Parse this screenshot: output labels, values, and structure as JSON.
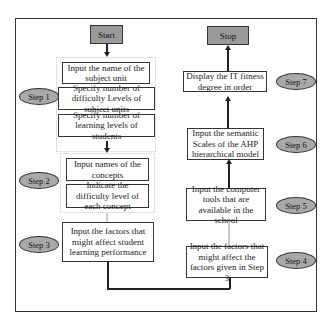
{
  "diagram": {
    "type": "flowchart",
    "start_label": "Start",
    "stop_label": "Stop",
    "left_column": {
      "step1": {
        "label": "Step 1",
        "boxes": [
          "Input the name of the subject unit",
          "Specify number of difficulty Levels of subject units",
          "Specify number of learning levels of students"
        ]
      },
      "step2": {
        "label": "Step 2",
        "boxes": [
          "Input names of the concepts",
          "Indicate the difficulty level of each concept"
        ]
      },
      "step3": {
        "label": "Step 3",
        "boxes": [
          "Input the factors that might affect student learning performance"
        ]
      }
    },
    "right_column": {
      "step4": {
        "label": "Step 4",
        "box": "Input the factors that might affect the factors given in Step 3"
      },
      "step5": {
        "label": "Step 5",
        "box": "Input the computer tools that are available in the school"
      },
      "step6": {
        "label": "Step 6",
        "box": "Input the semantic Scales of the AHP hierarchical model"
      },
      "step7": {
        "label": "Step 7",
        "box": "Display the IT fitness degree in order"
      }
    },
    "colors": {
      "terminal_fill": "#9a9a9a",
      "step_oval_fill": "#a9a9a9",
      "box_fill": "#ffffff",
      "line": "#222222"
    }
  }
}
